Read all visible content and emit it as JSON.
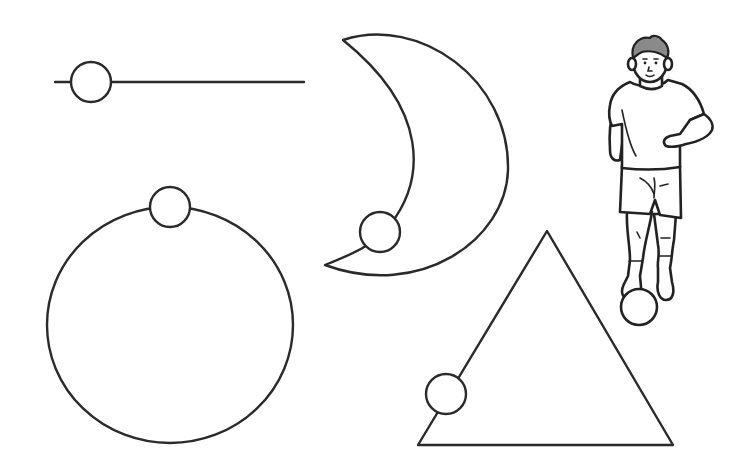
{
  "diagram": {
    "description": "Balls placed on different shapes: a straight line, a circle, a crescent moon, a triangle, and a boy dribbling a soccer ball",
    "colors": {
      "background": "#ffffff",
      "stroke": "#2a2a2a",
      "hair": "#8a8a8a"
    },
    "figures": [
      {
        "id": "line",
        "label": "Straight line with ball",
        "ball_position": "left end"
      },
      {
        "id": "circle",
        "label": "Circle with ball",
        "ball_position": "top"
      },
      {
        "id": "crescent",
        "label": "Crescent moon with ball",
        "ball_position": "lower inner curve"
      },
      {
        "id": "triangle",
        "label": "Triangle with ball",
        "ball_position": "lower left side"
      },
      {
        "id": "boy",
        "label": "Boy dribbling a ball",
        "ball_position": "at foot"
      }
    ]
  }
}
